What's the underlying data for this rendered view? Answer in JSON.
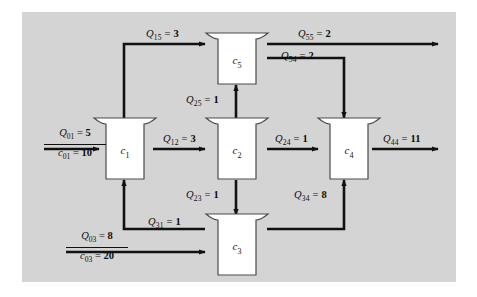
{
  "figure": {
    "background_color": "#d4d4d4",
    "node_fill": "#ffffff",
    "line_color": "#111111"
  },
  "nodes": [
    {
      "id": "c1",
      "label": "c",
      "sub": "1"
    },
    {
      "id": "c2",
      "label": "c",
      "sub": "2"
    },
    {
      "id": "c3",
      "label": "c",
      "sub": "3"
    },
    {
      "id": "c4",
      "label": "c",
      "sub": "4"
    },
    {
      "id": "c5",
      "label": "c",
      "sub": "5"
    }
  ],
  "flows": [
    {
      "id": "Q01",
      "symbol": "Q",
      "sub": "01",
      "eq": "=",
      "value": "5",
      "from": "source",
      "to": "c1"
    },
    {
      "id": "c01",
      "symbol": "c",
      "sub": "01",
      "eq": "=",
      "value": "10",
      "from": "source",
      "to": "c1"
    },
    {
      "id": "Q03",
      "symbol": "Q",
      "sub": "03",
      "eq": "=",
      "value": "8",
      "from": "source",
      "to": "c3"
    },
    {
      "id": "c03",
      "symbol": "c",
      "sub": "03",
      "eq": "=",
      "value": "20",
      "from": "source",
      "to": "c3"
    },
    {
      "id": "Q15",
      "symbol": "Q",
      "sub": "15",
      "eq": "=",
      "value": "3",
      "from": "c1",
      "to": "c5"
    },
    {
      "id": "Q12",
      "symbol": "Q",
      "sub": "12",
      "eq": "=",
      "value": "3",
      "from": "c1",
      "to": "c2"
    },
    {
      "id": "Q25",
      "symbol": "Q",
      "sub": "25",
      "eq": "=",
      "value": "1",
      "from": "c2",
      "to": "c5"
    },
    {
      "id": "Q23",
      "symbol": "Q",
      "sub": "23",
      "eq": "=",
      "value": "1",
      "from": "c2",
      "to": "c3"
    },
    {
      "id": "Q24",
      "symbol": "Q",
      "sub": "24",
      "eq": "=",
      "value": "1",
      "from": "c2",
      "to": "c4"
    },
    {
      "id": "Q31",
      "symbol": "Q",
      "sub": "31",
      "eq": "=",
      "value": "1",
      "from": "c3",
      "to": "c1"
    },
    {
      "id": "Q34",
      "symbol": "Q",
      "sub": "34",
      "eq": "=",
      "value": "8",
      "from": "c3",
      "to": "c4"
    },
    {
      "id": "Q54",
      "symbol": "Q",
      "sub": "54",
      "eq": "=",
      "value": "2",
      "from": "c5",
      "to": "c4"
    },
    {
      "id": "Q55",
      "symbol": "Q",
      "sub": "55",
      "eq": "=",
      "value": "2",
      "from": "c5",
      "to": "outlet"
    },
    {
      "id": "Q44",
      "symbol": "Q",
      "sub": "44",
      "eq": "=",
      "value": "11",
      "from": "c4",
      "to": "outlet"
    }
  ],
  "labels": {
    "Q01": {
      "text": "Q",
      "sub": "01",
      "eq": "=",
      "val": "5"
    },
    "c01": {
      "text": "c",
      "sub": "01",
      "eq": "=",
      "val": "10"
    },
    "Q03": {
      "text": "Q",
      "sub": "03",
      "eq": "=",
      "val": "8"
    },
    "c03": {
      "text": "c",
      "sub": "03",
      "eq": "=",
      "val": "20"
    },
    "Q15": {
      "text": "Q",
      "sub": "15",
      "eq": "=",
      "val": "3"
    },
    "Q12": {
      "text": "Q",
      "sub": "12",
      "eq": "=",
      "val": "3"
    },
    "Q25": {
      "text": "Q",
      "sub": "25",
      "eq": "=",
      "val": "1"
    },
    "Q23": {
      "text": "Q",
      "sub": "23",
      "eq": "=",
      "val": "1"
    },
    "Q24": {
      "text": "Q",
      "sub": "24",
      "eq": "=",
      "val": "1"
    },
    "Q31": {
      "text": "Q",
      "sub": "31",
      "eq": "=",
      "val": "1"
    },
    "Q34": {
      "text": "Q",
      "sub": "34",
      "eq": "=",
      "val": "8"
    },
    "Q54": {
      "text": "Q",
      "sub": "54",
      "eq": "=",
      "val": "2"
    },
    "Q55": {
      "text": "Q",
      "sub": "55",
      "eq": "=",
      "val": "2"
    },
    "Q44": {
      "text": "Q",
      "sub": "44",
      "eq": "=",
      "val": "11"
    }
  }
}
